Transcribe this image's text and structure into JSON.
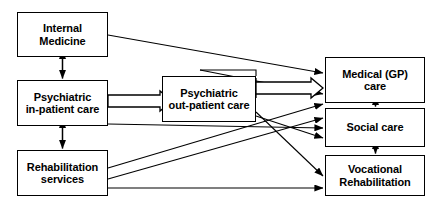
{
  "diagram": {
    "type": "flow-diagram",
    "background_color": "#ffffff",
    "line_color": "#000000",
    "box_border_color": "#000000",
    "box_fill_color": "#ffffff",
    "nodes": [
      {
        "id": "internal-medicine",
        "label": "Internal\nMedicine",
        "column": "left",
        "row": 1,
        "x": 17,
        "y": 12,
        "width": 91,
        "height": 45
      },
      {
        "id": "psychiatric-inpatient-care",
        "label": "Psychiatric\nin-patient care",
        "column": "left",
        "row": 2,
        "x": 17,
        "y": 80,
        "width": 91,
        "height": 46
      },
      {
        "id": "rehabilitation-services",
        "label": "Rehabilitation\nservices",
        "column": "left",
        "row": 3,
        "x": 17,
        "y": 150,
        "width": 91,
        "height": 46
      },
      {
        "id": "psychiatric-outpatient-care",
        "label": "Psychiatric\nout-patient care",
        "column": "middle",
        "row": 2,
        "x": 162,
        "y": 76,
        "width": 94,
        "height": 46
      },
      {
        "id": "medical-gp-care",
        "label": "Medical (GP)\ncare",
        "column": "right",
        "row": 1,
        "x": 325,
        "y": 57,
        "width": 100,
        "height": 46
      },
      {
        "id": "social-care",
        "label": "Social care",
        "column": "right",
        "row": 2,
        "x": 325,
        "y": 108,
        "width": 100,
        "height": 39
      },
      {
        "id": "vocational-rehabilitation",
        "label": "Vocational\nRehabilitation",
        "column": "right",
        "row": 3,
        "x": 325,
        "y": 155,
        "width": 100,
        "height": 41
      }
    ],
    "edges": [
      {
        "id": "e1",
        "from": "internal-medicine",
        "to": "psychiatric-inpatient-care",
        "style": "double-headed-vertical"
      },
      {
        "id": "e2",
        "from": "psychiatric-inpatient-care",
        "to": "rehabilitation-services",
        "style": "double-headed-vertical"
      },
      {
        "id": "e3",
        "from": "medical-gp-care",
        "to": "social-care",
        "style": "double-headed-vertical"
      },
      {
        "id": "e4",
        "from": "social-care",
        "to": "vocational-rehabilitation",
        "style": "double-headed-vertical"
      },
      {
        "id": "e5",
        "from": "internal-medicine",
        "to": "medical-gp-care",
        "style": "thin-arrow"
      },
      {
        "id": "e6",
        "from": "psychiatric-inpatient-care",
        "to": "psychiatric-outpatient-care",
        "style": "hollow-thick-arrow"
      },
      {
        "id": "e7",
        "from": "psychiatric-outpatient-care",
        "to": "medical-gp-care",
        "style": "hollow-thick-arrow"
      },
      {
        "id": "e8",
        "from": "psychiatric-outpatient-care",
        "to": "medical-gp-care",
        "style": "thin-arrow"
      },
      {
        "id": "e9",
        "from": "psychiatric-inpatient-care",
        "to": "social-care",
        "style": "thin-arrow"
      },
      {
        "id": "e10",
        "from": "psychiatric-outpatient-care",
        "to": "social-care",
        "style": "thin-arrow"
      },
      {
        "id": "e11",
        "from": "psychiatric-outpatient-care",
        "to": "vocational-rehabilitation",
        "style": "thin-arrow"
      },
      {
        "id": "e12",
        "from": "rehabilitation-services",
        "to": "medical-gp-care",
        "style": "thin-arrow"
      },
      {
        "id": "e13",
        "from": "rehabilitation-services",
        "to": "social-care",
        "style": "thin-arrow"
      },
      {
        "id": "e14",
        "from": "rehabilitation-services",
        "to": "vocational-rehabilitation",
        "style": "thin-arrow"
      }
    ]
  }
}
